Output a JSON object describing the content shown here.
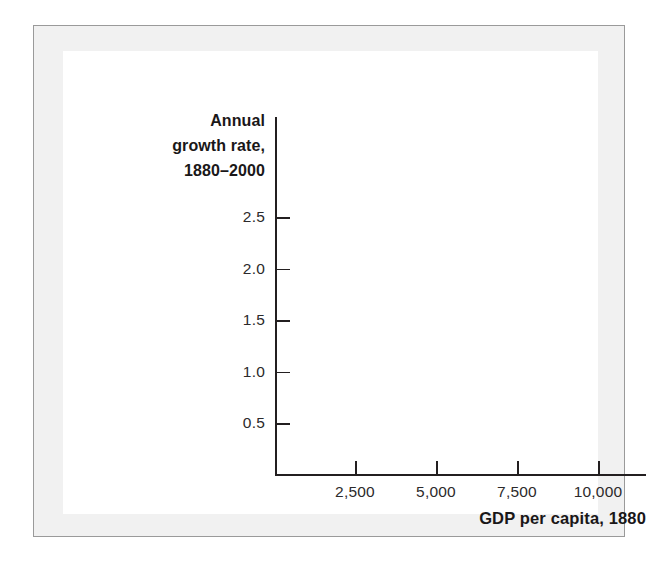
{
  "figure": {
    "frame_border_color": "#9a9a9a",
    "frame_background_color": "#f1f1f1",
    "panel_background_color": "#ffffff"
  },
  "chart_data": {
    "type": "scatter",
    "title": "",
    "subtitle": "",
    "xlabel": "GDP per capita, 1880",
    "ylabel_lines": [
      "Annual",
      "growth rate,",
      "1880–2000"
    ],
    "ylabel": "Annual growth rate, 1880–2000",
    "x_tick_labels": [
      "2,500",
      "5,000",
      "7,500",
      "10,000"
    ],
    "x_tick_values": [
      2500,
      5000,
      7500,
      10000
    ],
    "y_tick_labels": [
      "0.5",
      "1.0",
      "1.5",
      "2.0",
      "2.5"
    ],
    "y_tick_values": [
      0.5,
      1.0,
      1.5,
      2.0,
      2.5
    ],
    "xlim": [
      0,
      11400
    ],
    "ylim": [
      0,
      2.9
    ],
    "grid": false,
    "legend": null,
    "series": [
      {
        "name": "",
        "x": [],
        "y": []
      }
    ],
    "annotations": [],
    "note": "Empty axes template: no data points are plotted in the figure."
  }
}
